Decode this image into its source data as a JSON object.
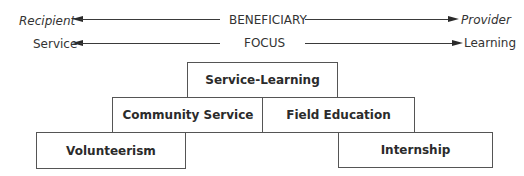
{
  "axes": [
    {
      "name": "beneficiary",
      "center_label": "BENEFICIARY",
      "left_label": "Recipient",
      "right_label": "Provider",
      "end_labels_italic": true
    },
    {
      "name": "focus",
      "center_label": "FOCUS",
      "left_label": "Service",
      "right_label": "Learning",
      "end_labels_italic": false
    }
  ],
  "boxes": {
    "service_learning": "Service-Learning",
    "community_service": "Community Service",
    "field_education": "Field Education",
    "volunteerism": "Volunteerism",
    "internship": "Internship"
  }
}
